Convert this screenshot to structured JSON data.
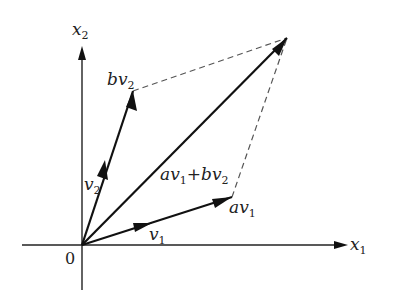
{
  "diagram": {
    "axes": {
      "x1": {
        "label": "x",
        "sub": "1"
      },
      "x2": {
        "label": "x",
        "sub": "2"
      },
      "origin_label": "0"
    },
    "vectors": [
      {
        "id": "v1",
        "label": "v",
        "sub": "1"
      },
      {
        "id": "v2",
        "label": "v",
        "sub": "2"
      },
      {
        "id": "av1",
        "label": "av",
        "sub": "1"
      },
      {
        "id": "bv2",
        "label": "bv",
        "sub": "2"
      },
      {
        "id": "sum",
        "label_parts": [
          "av",
          "1",
          "+bv",
          "2"
        ]
      }
    ],
    "colors": {
      "stroke": "#111111",
      "dashed": "#555555"
    }
  }
}
